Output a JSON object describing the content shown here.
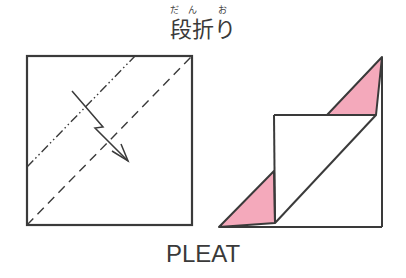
{
  "header": {
    "ruby": "だん お",
    "title": "段折り"
  },
  "caption": "PLEAT",
  "colors": {
    "line": "#3a3a3a",
    "pink": "#f4a9bb"
  },
  "figures": [
    {
      "name": "before-fold",
      "square": {
        "x": 27,
        "y": 56,
        "w": 165,
        "h": 169
      },
      "mountain_fold_line": {
        "x1": 27,
        "y1": 167,
        "x2": 135,
        "y2": 56
      },
      "valley_fold_line": {
        "x1": 27,
        "y1": 225,
        "x2": 192,
        "y2": 56
      },
      "arrow": "pleat-arrow"
    },
    {
      "name": "after-fold",
      "outline": "square with pleated diagonal and pink triangles"
    }
  ]
}
